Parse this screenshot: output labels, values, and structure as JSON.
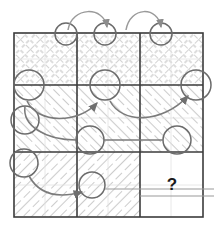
{
  "figure": {
    "kind": "matrix-reasoning-puzzle",
    "grid": {
      "rows": 3,
      "cols": 3,
      "x": 14,
      "y": 33,
      "width": 189,
      "height": 184
    },
    "missing_cell_label": "?",
    "colors": {
      "grid_line": "#3b3b3b",
      "hatch_light": "#c9c9c9",
      "hatch_mid": "#9a9a9a",
      "arrow": "#8c8c8c",
      "arrow_dark": "#6f6f6f",
      "circle": "#6b6b6b",
      "question_mark": "#1a1a1a",
      "background": "#ffffff"
    },
    "cells": [
      {
        "id": "r1c1",
        "row": 1,
        "col": 1,
        "fill_pattern": "cross-hatch",
        "content": "hatched"
      },
      {
        "id": "r1c2",
        "row": 1,
        "col": 2,
        "fill_pattern": "cross-hatch",
        "content": "hatched"
      },
      {
        "id": "r1c3",
        "row": 1,
        "col": 3,
        "fill_pattern": "cross-hatch",
        "content": "hatched"
      },
      {
        "id": "r2c1",
        "row": 2,
        "col": 1,
        "fill_pattern": "diagonal-up",
        "content": "hatched"
      },
      {
        "id": "r2c2",
        "row": 2,
        "col": 2,
        "fill_pattern": "diagonal-up",
        "content": "hatched"
      },
      {
        "id": "r2c3",
        "row": 2,
        "col": 3,
        "fill_pattern": "diagonal-up",
        "content": "hatched"
      },
      {
        "id": "r3c1",
        "row": 3,
        "col": 1,
        "fill_pattern": "diagonal-down",
        "content": "hatched"
      },
      {
        "id": "r3c2",
        "row": 3,
        "col": 2,
        "fill_pattern": "diagonal-down",
        "content": "hatched"
      },
      {
        "id": "r3c3",
        "row": 3,
        "col": 3,
        "fill_pattern": "none",
        "content": "missing"
      }
    ],
    "circles": [
      {
        "id": "c-top-1",
        "cx": 66,
        "cy": 34,
        "r": 11
      },
      {
        "id": "c-top-2",
        "cx": 105,
        "cy": 34,
        "r": 11
      },
      {
        "id": "c-top-3",
        "cx": 161,
        "cy": 34,
        "r": 11
      },
      {
        "id": "c-mid-1",
        "cx": 29,
        "cy": 85,
        "r": 15
      },
      {
        "id": "c-mid-2",
        "cx": 105,
        "cy": 85,
        "r": 15
      },
      {
        "id": "c-mid-3",
        "cx": 196,
        "cy": 85,
        "r": 15
      },
      {
        "id": "c-left-1",
        "cx": 25,
        "cy": 120,
        "r": 14
      },
      {
        "id": "c-row-1",
        "cx": 90,
        "cy": 140,
        "r": 14
      },
      {
        "id": "c-row-2",
        "cx": 177,
        "cy": 140,
        "r": 14
      },
      {
        "id": "c-left-2",
        "cx": 24,
        "cy": 163,
        "r": 14
      },
      {
        "id": "c-bot-1",
        "cx": 92,
        "cy": 185,
        "r": 13
      }
    ],
    "arrows": [
      {
        "id": "arc-top-left",
        "from": "r1c1",
        "to": "r1c2",
        "style": "curved-arc"
      },
      {
        "id": "arc-top-right",
        "from": "r1c2",
        "to": "r1c3",
        "style": "curved-arc"
      },
      {
        "id": "arc-row2-left",
        "from": "r2c1",
        "to": "r2c2",
        "style": "curved-arc"
      },
      {
        "id": "arc-row2-right",
        "from": "r2c2",
        "to": "r2c3",
        "style": "curved-arc"
      },
      {
        "id": "arc-row3-left",
        "from": "r3c1",
        "to": "r3c2",
        "style": "curved-arc"
      },
      {
        "id": "line-row-connect",
        "from": "c-row-1",
        "to": "c-row-2",
        "style": "straight"
      }
    ]
  }
}
